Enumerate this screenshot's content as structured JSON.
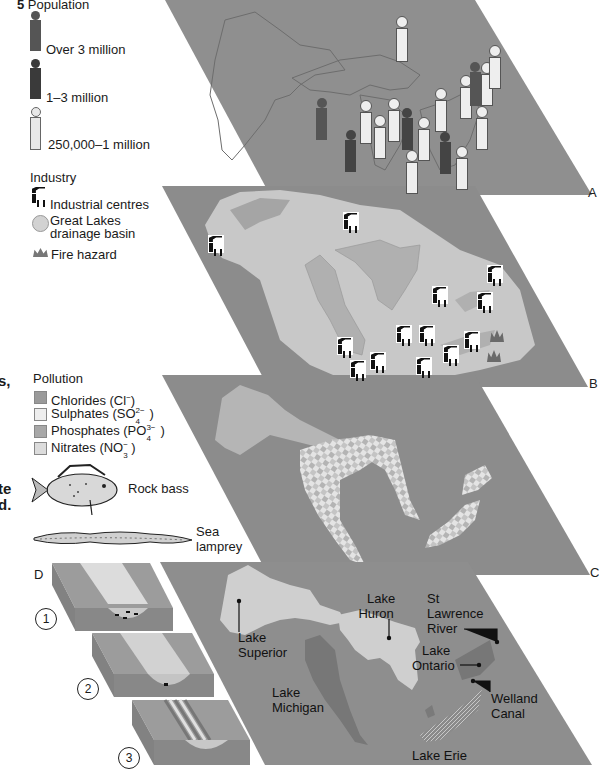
{
  "legend": {
    "population": {
      "number": "5",
      "title": "Population",
      "items": [
        {
          "label": "Over 3 million",
          "color": "#555555"
        },
        {
          "label": "1–3 million",
          "color": "#3a3a3a"
        },
        {
          "label": "250,000–1 million",
          "color": "#e8e8e8"
        }
      ]
    },
    "industry": {
      "title": "Industry",
      "items": [
        {
          "label": "Industrial centres",
          "icon": "factory-icon"
        },
        {
          "label": "Great Lakes drainage basin",
          "line1": "Great Lakes",
          "line2": "drainage basin",
          "icon": "basin-circle-icon"
        },
        {
          "label": "Fire hazard",
          "icon": "fire-icon"
        }
      ]
    },
    "pollution": {
      "title": "Pollution",
      "items": [
        {
          "label": "Chlorides (Cl⁻)",
          "base": "Chlorides (Cl",
          "sup": "−",
          "sub": "",
          "close": ")",
          "color": "#9a9a9a"
        },
        {
          "label": "Sulphates (SO₄²⁻)",
          "base": "Sulphates (SO",
          "sup": "2−",
          "sub": "4",
          "close": ")",
          "color": "#eeeeee"
        },
        {
          "label": "Phosphates (PO₄³⁻)",
          "base": "Phosphates (PO",
          "sup": "3−",
          "sub": "4",
          "close": ")",
          "color": "#a8a8a8"
        },
        {
          "label": "Nitrates (NO₃⁻)",
          "base": "Nitrates (NO",
          "sup": "−",
          "sub": "3",
          "close": ")",
          "color": "#dcdcdc"
        }
      ]
    },
    "species": [
      {
        "label": "Rock bass",
        "icon": "rock-bass-icon"
      },
      {
        "label": "Sea lamprey",
        "line1": "Sea",
        "line2": "lamprey",
        "icon": "sea-lamprey-icon"
      }
    ]
  },
  "left_fragments": {
    "frag1": "s,",
    "frag2": "te",
    "frag3": "d."
  },
  "panel_d": {
    "label": "D",
    "steps": [
      "1",
      "2",
      "3"
    ]
  },
  "panel_edge_labels": [
    "A",
    "B",
    "C"
  ],
  "map_labels": {
    "lake_superior": {
      "line1": "Lake",
      "line2": "Superior"
    },
    "lake_huron": {
      "line1": "Lake",
      "line2": "Huron"
    },
    "lake_michigan": {
      "line1": "Lake",
      "line2": "Michigan"
    },
    "st_lawrence": {
      "line1": "St",
      "line2": "Lawrence",
      "line3": "River"
    },
    "lake_ontario": {
      "line1": "Lake",
      "line2": "Ontario"
    },
    "welland_canal": {
      "line1": "Welland",
      "line2": "Canal"
    },
    "lake_erie": "Lake Erie"
  },
  "colors": {
    "plane": "#8e8e8e",
    "plane_dark": "#7c7c7c",
    "basin": "#c9c9c9",
    "lake_light": "#d4d4d4",
    "lake_mid": "#a6a6a6"
  }
}
